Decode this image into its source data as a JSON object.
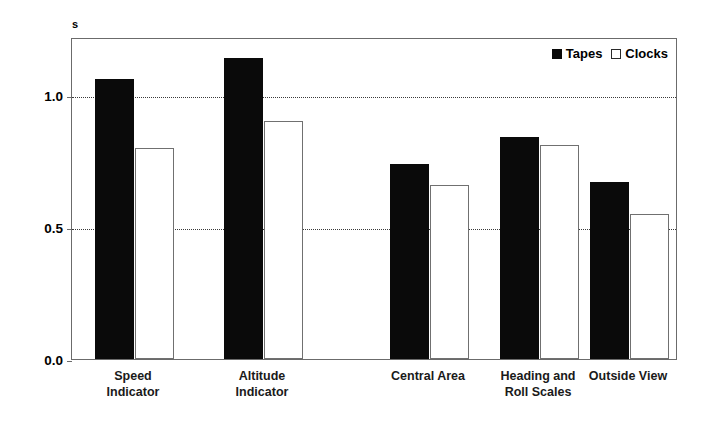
{
  "chart_data": {
    "type": "bar",
    "title": "",
    "xlabel": "",
    "ylabel": "s",
    "ylim": [
      0.0,
      1.22
    ],
    "yticks": [
      "0.0",
      "0.5",
      "1.0"
    ],
    "ytick_values": [
      0.0,
      0.5,
      1.0
    ],
    "grid": true,
    "legend_position": "top-right",
    "categories": [
      "Speed\nIndicator",
      "Altitude\nIndicator",
      "Central Area",
      "Heading and\nRoll Scales",
      "Outside View"
    ],
    "series": [
      {
        "name": "Tapes",
        "values": [
          1.06,
          1.14,
          0.74,
          0.84,
          0.67
        ],
        "color": "#0a0a0a",
        "style": "filled"
      },
      {
        "name": "Clocks",
        "values": [
          0.8,
          0.9,
          0.66,
          0.81,
          0.55
        ],
        "color": "#ffffff",
        "style": "hollow"
      }
    ]
  },
  "axis": {
    "unit_label": "s",
    "tick_0": "0.0",
    "tick_1": "0.5",
    "tick_2": "1.0"
  },
  "legend": {
    "tapes_label": "Tapes",
    "clocks_label": "Clocks"
  },
  "categories": {
    "c0": "Speed\nIndicator",
    "c1": "Altitude\nIndicator",
    "c2": "Central Area",
    "c3": "Heading and\nRoll Scales",
    "c4": "Outside View"
  }
}
